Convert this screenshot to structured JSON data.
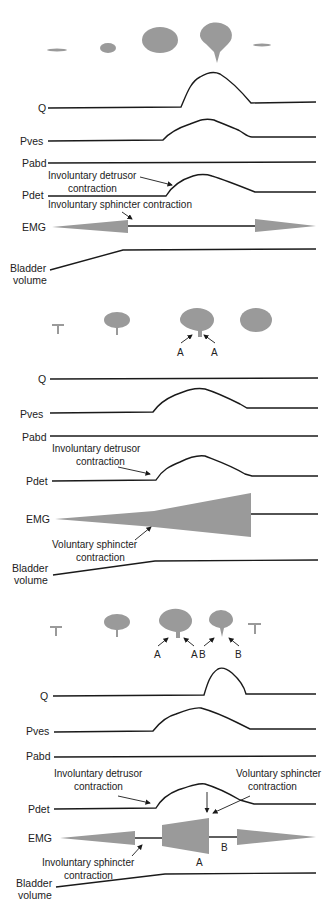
{
  "figure": {
    "panels": [
      {
        "id": "panel-1",
        "trace_labels": {
          "q": "Q",
          "pves": "Pves",
          "pabd": "Pabd",
          "pdet": "Pdet",
          "emg": "EMG",
          "volume_1": "Bladder",
          "volume_2": "volume"
        },
        "annotations": {
          "detrusor": "Involuntary detrusor",
          "detrusor_2": "contraction",
          "sphincter": "Involuntary sphincter contraction"
        }
      },
      {
        "id": "panel-2",
        "trace_labels": {
          "q": "Q",
          "pves": "Pves",
          "pabd": "Pabd",
          "pdet": "Pdet",
          "emg": "EMG",
          "volume_1": "Bladder",
          "volume_2": "volume"
        },
        "annotations": {
          "detrusor": "Involuntary detrusor",
          "detrusor_2": "contraction",
          "sphincter": "Voluntary sphincter",
          "sphincter_2": "contraction",
          "bladder_a1": "A",
          "bladder_a2": "A"
        }
      },
      {
        "id": "panel-3",
        "trace_labels": {
          "q": "Q",
          "pves": "Pves",
          "pabd": "Pabd",
          "pdet": "Pdet",
          "emg": "EMG",
          "volume_1": "Bladder",
          "volume_2": "volume"
        },
        "annotations": {
          "detrusor": "Involuntary detrusor",
          "detrusor_2": "contraction",
          "vol_sphincter": "Voluntary sphincter",
          "vol_sphincter_2": "contraction",
          "inv_sphincter": "Involuntary sphincter",
          "inv_sphincter_2": "contraction",
          "bladder_a1": "A",
          "bladder_a2": "A",
          "bladder_b1": "B",
          "bladder_b2": "B",
          "emg_a": "A",
          "emg_b": "B"
        }
      }
    ],
    "colors": {
      "trace": "#1a1a1a",
      "shape": "#9a9a9a",
      "background": "#ffffff"
    }
  }
}
